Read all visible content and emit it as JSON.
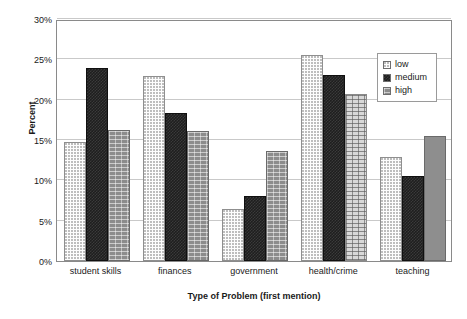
{
  "chart_data": {
    "type": "bar",
    "title": "",
    "xlabel": "Type of Problem (first mention)",
    "ylabel": "Percent",
    "categories": [
      "student skills",
      "finances",
      "government",
      "health/crime",
      "teaching"
    ],
    "series": [
      {
        "name": "low",
        "values": [
          14.8,
          22.9,
          6.4,
          25.6,
          12.9
        ]
      },
      {
        "name": "medium",
        "values": [
          23.9,
          18.3,
          8.1,
          23.1,
          10.6
        ]
      },
      {
        "name": "high",
        "values": [
          16.2,
          16.1,
          13.6,
          20.7,
          15.5
        ]
      }
    ],
    "ylim": [
      0,
      30
    ],
    "ytick_values": [
      0,
      5,
      10,
      15,
      20,
      25,
      30
    ],
    "ytick_labels": [
      "0%",
      "5%",
      "10%",
      "15%",
      "20%",
      "25%",
      "30%"
    ],
    "grid": "horizontal",
    "legend_position": "top-right",
    "legend_entries": [
      "low",
      "medium",
      "high"
    ],
    "series_styles": [
      "dotted-light",
      "solid-dark",
      "gray-brick"
    ]
  },
  "legend": {
    "items": [
      {
        "label": "low"
      },
      {
        "label": "medium"
      },
      {
        "label": "high"
      }
    ]
  },
  "axes": {
    "y_title": "Percent",
    "x_title": "Type of Problem (first mention)"
  },
  "colors": {
    "low": "#fdfdfd",
    "medium": "#1e1e1e",
    "high": "#8c8c8c",
    "gridline": "#c9c9c9",
    "axis": "#8a8a8a",
    "text": "#1a1a1a"
  }
}
